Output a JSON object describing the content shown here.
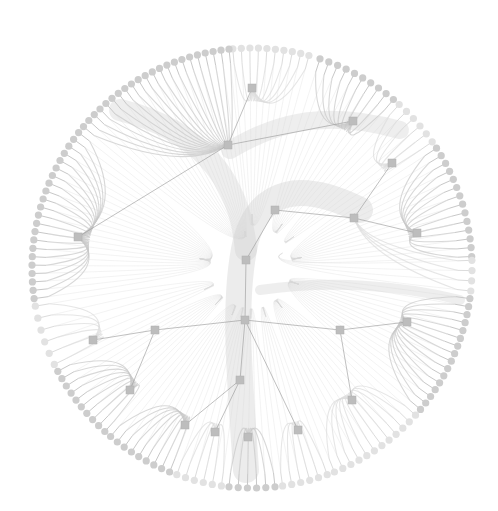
{
  "diagram": {
    "type": "radial-edge-bundled-network",
    "width": 498,
    "height": 511,
    "center": [
      252,
      268
    ],
    "radius": 220,
    "colors": {
      "background": "#ffffff",
      "edge": "#c8c8c8",
      "edge_dark": "#a8a8a8",
      "leaf_node": "#cdcdcd",
      "leaf_node_light": "#e2e2e2",
      "hub_node": "#bdbdbd",
      "hub_edge": "#9a9a9a"
    },
    "hubs": [
      {
        "id": "h1",
        "x": 252,
        "y": 88
      },
      {
        "id": "h2",
        "x": 353,
        "y": 121
      },
      {
        "id": "h3",
        "x": 228,
        "y": 145
      },
      {
        "id": "h4",
        "x": 392,
        "y": 163
      },
      {
        "id": "h5",
        "x": 275,
        "y": 210
      },
      {
        "id": "h6",
        "x": 354,
        "y": 218
      },
      {
        "id": "h7",
        "x": 417,
        "y": 233
      },
      {
        "id": "h8",
        "x": 78,
        "y": 237
      },
      {
        "id": "h9",
        "x": 246,
        "y": 260
      },
      {
        "id": "h10",
        "x": 245,
        "y": 320
      },
      {
        "id": "h11",
        "x": 155,
        "y": 330
      },
      {
        "id": "h12",
        "x": 93,
        "y": 340
      },
      {
        "id": "h13",
        "x": 340,
        "y": 330
      },
      {
        "id": "h14",
        "x": 407,
        "y": 322
      },
      {
        "id": "h15",
        "x": 130,
        "y": 390
      },
      {
        "id": "h16",
        "x": 352,
        "y": 400
      },
      {
        "id": "h17",
        "x": 240,
        "y": 380
      },
      {
        "id": "h18",
        "x": 185,
        "y": 425
      },
      {
        "id": "h19",
        "x": 215,
        "y": 432
      },
      {
        "id": "h20",
        "x": 298,
        "y": 430
      },
      {
        "id": "h21",
        "x": 248,
        "y": 437
      }
    ],
    "hub_links": [
      [
        "h3",
        "h2"
      ],
      [
        "h5",
        "h6"
      ],
      [
        "h6",
        "h7"
      ],
      [
        "h4",
        "h6"
      ],
      [
        "h8",
        "h3"
      ],
      [
        "h5",
        "h9"
      ],
      [
        "h9",
        "h10"
      ],
      [
        "h11",
        "h12"
      ],
      [
        "h10",
        "h11"
      ],
      [
        "h10",
        "h13"
      ],
      [
        "h13",
        "h14"
      ],
      [
        "h13",
        "h16"
      ],
      [
        "h11",
        "h15"
      ],
      [
        "h10",
        "h17"
      ],
      [
        "h17",
        "h19"
      ],
      [
        "h17",
        "h18"
      ],
      [
        "h10",
        "h20"
      ],
      [
        "h1",
        "h3"
      ]
    ],
    "clusters": [
      {
        "hub": "h1",
        "from_deg": -95,
        "to_deg": -75,
        "count": 10,
        "shade": "light"
      },
      {
        "hub": "h2",
        "from_deg": -72,
        "to_deg": -50,
        "count": 10,
        "shade": "dark"
      },
      {
        "hub": "h4",
        "from_deg": -48,
        "to_deg": -35,
        "count": 6,
        "shade": "light"
      },
      {
        "hub": "h7",
        "from_deg": -33,
        "to_deg": -3,
        "count": 14,
        "shade": "dark"
      },
      {
        "hub": "h6",
        "from_deg": -2,
        "to_deg": 6,
        "count": 4,
        "shade": "light"
      },
      {
        "hub": "h14",
        "from_deg": 8,
        "to_deg": 40,
        "count": 16,
        "shade": "dark"
      },
      {
        "hub": "h16",
        "from_deg": 42,
        "to_deg": 68,
        "count": 12,
        "shade": "light"
      },
      {
        "hub": "h20",
        "from_deg": 70,
        "to_deg": 82,
        "count": 6,
        "shade": "light"
      },
      {
        "hub": "h21",
        "from_deg": 84,
        "to_deg": 96,
        "count": 6,
        "shade": "dark"
      },
      {
        "hub": "h19",
        "from_deg": 98,
        "to_deg": 110,
        "count": 6,
        "shade": "light"
      },
      {
        "hub": "h18",
        "from_deg": 112,
        "to_deg": 130,
        "count": 9,
        "shade": "dark"
      },
      {
        "hub": "h15",
        "from_deg": 132,
        "to_deg": 152,
        "count": 10,
        "shade": "dark"
      },
      {
        "hub": "h12",
        "from_deg": 154,
        "to_deg": 170,
        "count": 6,
        "shade": "light"
      },
      {
        "hub": "h8",
        "from_deg": 172,
        "to_deg": 218,
        "count": 22,
        "shade": "dark"
      },
      {
        "hub": "h3",
        "from_deg": 220,
        "to_deg": 264,
        "count": 22,
        "shade": "dark"
      }
    ]
  }
}
